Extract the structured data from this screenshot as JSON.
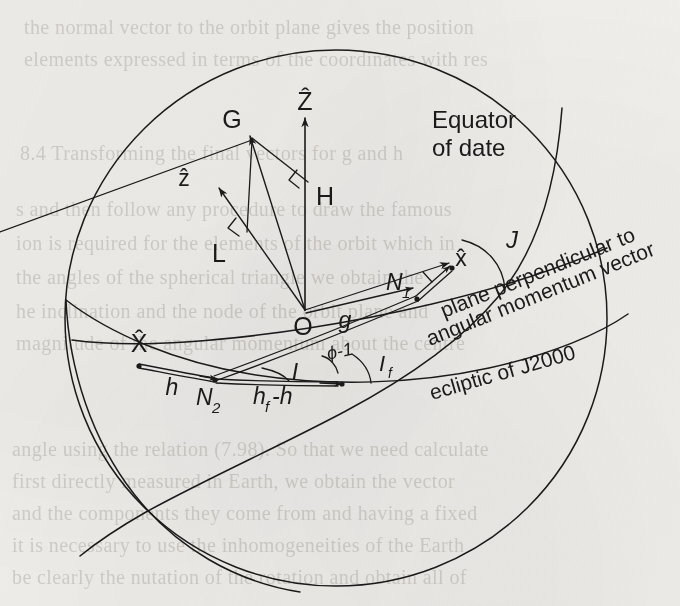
{
  "figure": {
    "kind": "celestial-sphere-angle-diagram",
    "background_color": "#f1efec",
    "ink_color": "#1b1b1b",
    "width": 680,
    "height": 606
  },
  "labels": {
    "z_axis_inertial": "Ẑ",
    "z_axis_body": "ẑ",
    "point_g": "G",
    "point_h": "H",
    "point_l": "L",
    "origin": "O",
    "x_axis_inertial": "X̂",
    "x_axis_body": "x̂",
    "node_n1": "N",
    "node_n1_sub": "1",
    "node_n2": "N",
    "node_n2_sub": "2",
    "angle_g": "g",
    "angle_h": "h",
    "angle_hf_minus_h": "h",
    "angle_hf_minus_h_sub": "f",
    "angle_hf_minus_h_tail": "-h",
    "angle_I": "I",
    "angle_If": "I",
    "angle_If_sub": "f",
    "angle_J": "J",
    "angle_phi": "ɸ-1"
  },
  "curve_labels": {
    "equator_line1": "Equator",
    "equator_line2": "of date",
    "plane_perp_line1": "plane perpendicular to",
    "plane_perp_line2": "angular momentum vector",
    "ecliptic": "ecliptic of J2000"
  },
  "ghost_text": {
    "note": "faint bleed-through text from the reverse side of the printed page",
    "lines": [
      {
        "text": "the normal vector to the orbit plane gives the position",
        "x": 24,
        "y": 16,
        "size": 20
      },
      {
        "text": "elements expressed in terms of the coordinates with res",
        "x": 24,
        "y": 48,
        "size": 20
      },
      {
        "text": "8.4 Transforming the final vectors for g and h",
        "x": 20,
        "y": 142,
        "size": 20
      },
      {
        "text": "s and then follow any procedure to draw the famous",
        "x": 16,
        "y": 198,
        "size": 20
      },
      {
        "text": "ion is required for the elements of the orbit which in",
        "x": 16,
        "y": 232,
        "size": 20
      },
      {
        "text": "the angles of the spherical triangle we obtain the",
        "x": 16,
        "y": 266,
        "size": 20
      },
      {
        "text": "he inclination and the node of the orbit plane and",
        "x": 16,
        "y": 300,
        "size": 20
      },
      {
        "text": "magnitude of the angular momentum about the centre",
        "x": 16,
        "y": 332,
        "size": 20
      },
      {
        "text": "angle using the relation (7.98). So that we need calculate",
        "x": 12,
        "y": 438,
        "size": 20
      },
      {
        "text": "first directly measured in Earth, we obtain the vector",
        "x": 12,
        "y": 470,
        "size": 20
      },
      {
        "text": "and the components they come from and having a fixed",
        "x": 12,
        "y": 502,
        "size": 20
      },
      {
        "text": "it is necessary to use the inhomogeneities of the Earth",
        "x": 12,
        "y": 534,
        "size": 20
      },
      {
        "text": "be clearly the nutation of the rotation and obtain all of",
        "x": 12,
        "y": 566,
        "size": 20
      }
    ]
  }
}
